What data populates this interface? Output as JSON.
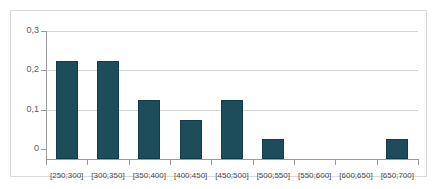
{
  "chart_data": {
    "type": "bar",
    "title": "",
    "subtitle": "",
    "xlabel": "",
    "ylabel": "",
    "categories": [
      "[250;300]",
      "[300;350]",
      "[350;400]",
      "[400;450]",
      "[450;500]",
      "[500;550]",
      "[550;600]",
      "[600;650]",
      "[650;700]"
    ],
    "values": [
      0.25,
      0.25,
      0.15,
      0.1,
      0.15,
      0.05,
      0,
      0,
      0.05
    ],
    "ylim": [
      0,
      0.3
    ],
    "ytick_labels": [
      "0,3",
      "0,2",
      "0,1",
      "0"
    ],
    "ytick_values": [
      0.3,
      0.2,
      0.1,
      0
    ],
    "grid": true,
    "legend": false,
    "legend_position": "none",
    "bar_color": "#1d4d5a",
    "bar_edge_color": "#123c47",
    "gridline_color": "#d6d6d6",
    "axis_color": "#9a9a9a",
    "frame_color": "#d9d9d9",
    "background_color": "#ffffff"
  }
}
